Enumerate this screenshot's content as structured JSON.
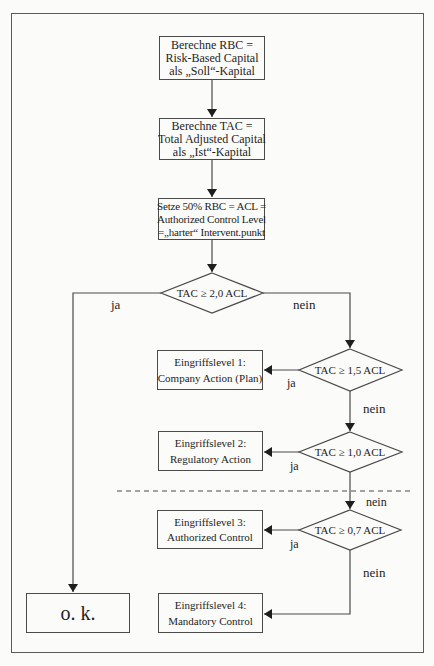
{
  "diagram": {
    "type": "flowchart",
    "language": "de",
    "process_steps": [
      {
        "id": "rbc",
        "lines": [
          "Berechne RBC =",
          "Risk-Based Capital",
          "als „Soll“-Kapital"
        ]
      },
      {
        "id": "tac",
        "lines": [
          "Berechne TAC =",
          "Total Adjusted Capital",
          "als „Ist“-Kapital"
        ]
      },
      {
        "id": "acl",
        "lines": [
          "Setze 50% RBC = ACL =",
          "Authorized Control Level",
          "=„harter“ Intervent.punkt"
        ]
      }
    ],
    "decisions": [
      {
        "id": "d1",
        "label": "TAC ≥ 2,0 ACL",
        "yes": "ja",
        "no": "nein"
      },
      {
        "id": "d2",
        "label": "TAC ≥ 1,5 ACL",
        "yes": "ja",
        "no": "nein"
      },
      {
        "id": "d3",
        "label": "TAC ≥ 1,0 ACL",
        "yes": "ja",
        "no": "nein"
      },
      {
        "id": "d4",
        "label": "TAC ≥ 0,7 ACL",
        "yes": "ja",
        "no": "nein"
      }
    ],
    "levels": [
      {
        "id": "l1",
        "title": "Eingriffslevel 1:",
        "action": "Company Action (Plan)"
      },
      {
        "id": "l2",
        "title": "Eingriffslevel 2:",
        "action": "Regulatory Action"
      },
      {
        "id": "l3",
        "title": "Eingriffslevel 3:",
        "action": "Authorized Control"
      },
      {
        "id": "l4",
        "title": "Eingriffslevel 4:",
        "action": "Mandatory Control"
      }
    ],
    "ok_box": {
      "label": "o. k."
    },
    "edges": [
      {
        "from": "rbc",
        "to": "tac"
      },
      {
        "from": "tac",
        "to": "acl"
      },
      {
        "from": "acl",
        "to": "d1"
      },
      {
        "from": "d1",
        "to": "ok",
        "label": "ja"
      },
      {
        "from": "d1",
        "to": "d2",
        "label": "nein"
      },
      {
        "from": "d2",
        "to": "l1",
        "label": "ja"
      },
      {
        "from": "d2",
        "to": "d3",
        "label": "nein"
      },
      {
        "from": "d3",
        "to": "l2",
        "label": "ja"
      },
      {
        "from": "d3",
        "to": "d4",
        "label": "nein"
      },
      {
        "from": "d4",
        "to": "l3",
        "label": "ja"
      },
      {
        "from": "d4",
        "to": "l4",
        "label": "nein"
      }
    ],
    "separator": {
      "style": "dashed",
      "between": [
        "l2",
        "l3"
      ]
    },
    "colors": {
      "line": "#4a4a4a",
      "background": "#fbfbf9",
      "text": "#1e1e1e"
    }
  }
}
